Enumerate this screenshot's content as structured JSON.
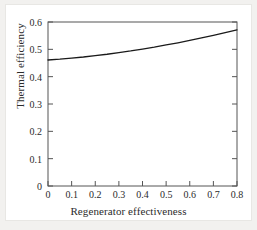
{
  "chart_data": {
    "type": "line",
    "title": "",
    "xlabel": "Regenerator effectiveness",
    "ylabel": "Thermal efficiency",
    "xlim": [
      0,
      0.8
    ],
    "ylim": [
      0,
      0.6
    ],
    "xticks": [
      "0",
      "0.1",
      "0.2",
      "0.3",
      "0.4",
      "0.5",
      "0.6",
      "0.7",
      "0.8"
    ],
    "xtick_values": [
      0,
      0.1,
      0.2,
      0.3,
      0.4,
      0.5,
      0.6,
      0.7,
      0.8
    ],
    "yticks": [
      "0",
      "0.1",
      "0.2",
      "0.3",
      "0.4",
      "0.5",
      "0.6"
    ],
    "ytick_values": [
      0,
      0.1,
      0.2,
      0.3,
      0.4,
      0.5,
      0.6
    ],
    "grid": false,
    "legend": false,
    "frame": "box",
    "tick_direction": "in",
    "line_color": "#1a1a1a",
    "line_width": 1.3,
    "series": [
      {
        "name": "Thermal efficiency",
        "x": [
          0,
          0.05,
          0.1,
          0.15,
          0.2,
          0.25,
          0.3,
          0.35,
          0.4,
          0.45,
          0.5,
          0.55,
          0.6,
          0.65,
          0.7,
          0.75,
          0.8
        ],
        "values": [
          0.461,
          0.464,
          0.468,
          0.472,
          0.477,
          0.482,
          0.488,
          0.494,
          0.501,
          0.508,
          0.516,
          0.524,
          0.533,
          0.542,
          0.551,
          0.561,
          0.571
        ]
      }
    ]
  }
}
